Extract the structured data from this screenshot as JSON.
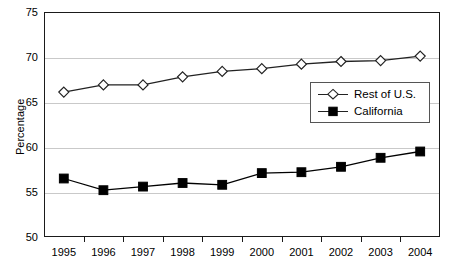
{
  "chart_data": {
    "type": "line",
    "title": "",
    "xlabel": "",
    "ylabel": "Percentage",
    "ylim": [
      50,
      75
    ],
    "yticks": [
      50,
      55,
      60,
      65,
      70,
      75
    ],
    "grid": true,
    "legend_position": "center-right",
    "categories": [
      "1995",
      "1996",
      "1997",
      "1998",
      "1999",
      "2000",
      "2001",
      "2002",
      "2003",
      "2004"
    ],
    "series": [
      {
        "name": "Rest of U.S.",
        "marker": "open-diamond",
        "color": "#222222",
        "values": [
          66.1,
          66.9,
          66.9,
          67.8,
          68.4,
          68.7,
          69.2,
          69.5,
          69.6,
          70.1
        ]
      },
      {
        "name": "California",
        "marker": "filled-square",
        "color": "#000000",
        "values": [
          56.5,
          55.2,
          55.6,
          56.0,
          55.8,
          57.1,
          57.2,
          57.8,
          58.8,
          59.5
        ]
      }
    ]
  },
  "axes": {
    "y_axis_title": "Percentage",
    "y_tick_labels": [
      "75",
      "70",
      "65",
      "60",
      "55",
      "50"
    ],
    "x_tick_labels": [
      "1995",
      "1996",
      "1997",
      "1998",
      "1999",
      "2000",
      "2001",
      "2002",
      "2003",
      "2004"
    ]
  },
  "legend": {
    "entries": [
      {
        "label": "Rest of U.S."
      },
      {
        "label": "California"
      }
    ]
  },
  "colors": {
    "frame": "#1a1a1a",
    "grid": "#c9c9c9",
    "line": "#222222",
    "marker_fill_open": "#ffffff",
    "marker_fill_solid": "#000000",
    "background": "#ffffff"
  }
}
